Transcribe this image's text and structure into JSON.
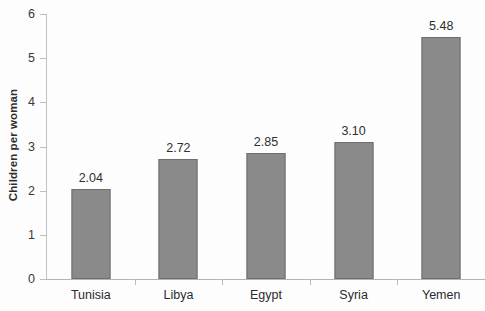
{
  "chart_data": {
    "type": "bar",
    "title": "",
    "subtitle": "",
    "xlabel": "",
    "ylabel": "Children per woman",
    "categories": [
      "Tunisia",
      "Libya",
      "Egypt",
      "Syria",
      "Yemen"
    ],
    "values": [
      2.04,
      2.72,
      2.85,
      3.1,
      5.48
    ],
    "value_labels": [
      "2.04",
      "2.72",
      "2.85",
      "3.10",
      "5.48"
    ],
    "ylim": [
      0,
      6
    ],
    "ytick_values": [
      0,
      1,
      2,
      3,
      4,
      5,
      6
    ],
    "ytick_labels": [
      "0",
      "1",
      "2",
      "3",
      "4",
      "5",
      "6"
    ],
    "ytick_step": 1,
    "grid": false,
    "legend": false,
    "legend_position": "none",
    "bar_color": "#8a8a8a",
    "bar_edge_color": "#6e6e6e",
    "axis_color": "#bdbdbd",
    "text_color": "#2f2f2f",
    "background": "#fdfdfd",
    "orientation": "vertical",
    "series": [
      {
        "name": "Total fertility rate",
        "values": [
          2.04,
          2.72,
          2.85,
          3.1,
          5.48
        ]
      }
    ]
  }
}
